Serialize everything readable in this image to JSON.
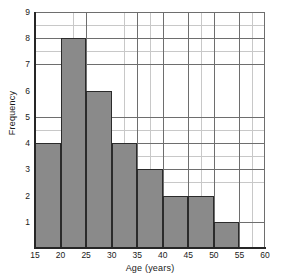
{
  "chart_data": {
    "type": "bar",
    "title": "",
    "subtitle": "",
    "xlabel": "Age (years)",
    "ylabel": "Frequency",
    "xlim": [
      15,
      60
    ],
    "ylim": [
      0,
      9
    ],
    "grid": true,
    "legend": "none",
    "bin_width": 5,
    "xticks": [
      15,
      20,
      25,
      30,
      35,
      40,
      45,
      50,
      55,
      60
    ],
    "yticks": [
      1,
      2,
      3,
      4,
      5,
      6,
      7,
      8,
      9
    ],
    "categories": [
      "15-20",
      "20-25",
      "25-30",
      "30-35",
      "35-40",
      "40-45",
      "45-50",
      "50-55",
      "55-60"
    ],
    "bin_edges": [
      15,
      20,
      25,
      30,
      35,
      40,
      45,
      50,
      55,
      60
    ],
    "values": [
      4,
      8,
      6,
      4,
      3,
      2,
      2,
      1,
      0
    ],
    "bars": [
      {
        "label": "15-20",
        "start": 15,
        "end": 20,
        "value": 4
      },
      {
        "label": "20-25",
        "start": 20,
        "end": 25,
        "value": 8
      },
      {
        "label": "25-30",
        "start": 25,
        "end": 30,
        "value": 6
      },
      {
        "label": "30-35",
        "start": 30,
        "end": 35,
        "value": 4
      },
      {
        "label": "35-40",
        "start": 35,
        "end": 40,
        "value": 3
      },
      {
        "label": "40-45",
        "start": 40,
        "end": 45,
        "value": 2
      },
      {
        "label": "45-50",
        "start": 45,
        "end": 50,
        "value": 2
      },
      {
        "label": "50-55",
        "start": 50,
        "end": 55,
        "value": 1
      },
      {
        "label": "55-60",
        "start": 55,
        "end": 60,
        "value": 0
      }
    ],
    "colors": {
      "bar_fill": "#8a8a8a",
      "bar_edge": "#2b2b2b",
      "axis": "#262626",
      "grid_major": "#6e6e6e",
      "grid_minor": "#c8c8c8",
      "background": "#ffffff",
      "text": "#1a1a1a"
    }
  }
}
